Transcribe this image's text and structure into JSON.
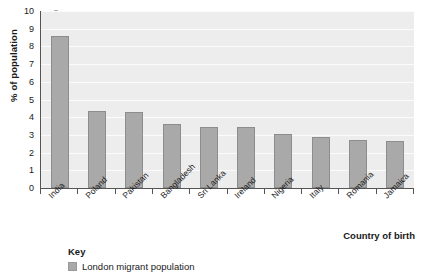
{
  "chart_data": {
    "type": "bar",
    "title": "",
    "xlabel": "Country of birth",
    "ylabel": "% of population",
    "ylim": [
      0,
      10
    ],
    "ytick_step": 1,
    "yticks": [
      10,
      9,
      8,
      7,
      6,
      5,
      4,
      3,
      2,
      1,
      0
    ],
    "grid": true,
    "legend_position": "bottom-left",
    "categories": [
      "India",
      "Poland",
      "Pakistan",
      "Bangladesh",
      "Sri Lanka",
      "Ireland",
      "Nigeria",
      "Italy",
      "Romania",
      "Jamaica"
    ],
    "series": [
      {
        "name": "London migrant population",
        "values": [
          8.6,
          4.35,
          4.3,
          3.6,
          3.45,
          3.45,
          3.05,
          2.9,
          2.7,
          2.65
        ],
        "color": "#a9a9a9"
      }
    ]
  },
  "legend": {
    "title": "Key",
    "entries": [
      {
        "label": "London migrant population",
        "color": "#a9a9a9"
      }
    ]
  },
  "colors": {
    "bar_fill": "#a9a9a9",
    "bar_border": "#8d8d8d",
    "plot_background": "#eeeeee",
    "gridline": "#fbfbfb",
    "axis": "#555555",
    "text": "#1a1a1a"
  }
}
